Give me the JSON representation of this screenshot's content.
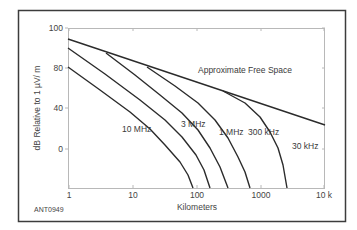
{
  "chart_data": {
    "type": "line",
    "title": "",
    "xlabel": "Kilometers",
    "ylabel": "dB Relative to 1 µV/ m",
    "xscale": "log",
    "xlim": [
      1,
      10000
    ],
    "x_ticks": [
      "1",
      "10",
      "100",
      "1000",
      "10 k"
    ],
    "y_ticks": [
      "100",
      "80",
      "40",
      "0"
    ],
    "grid": false,
    "figure_id": "ANT0949",
    "annotations": [
      "Approximate Free Space",
      "10 MHz",
      "3 MHz",
      "1 MHz",
      "300 kHz",
      "30 kHz"
    ],
    "series": [
      {
        "name": "Approximate Free Space",
        "x": [
          1,
          10000
        ],
        "y": [
          89,
          25
        ]
      },
      {
        "name": "10 MHz",
        "x": [
          1,
          9,
          27,
          57,
          90
        ],
        "y": [
          82,
          50,
          23,
          0,
          -20
        ]
      },
      {
        "name": "3 MHz",
        "x": [
          1,
          13,
          56,
          116,
          168
        ],
        "y": [
          94,
          53,
          27,
          3,
          -20
        ]
      },
      {
        "name": "1 MHz",
        "x": [
          4,
          27,
          94,
          193,
          308
        ],
        "y": [
          86,
          57,
          33,
          8,
          -20
        ]
      },
      {
        "name": "300 kHz",
        "x": [
          19,
          94,
          277,
          475,
          683
        ],
        "y": [
          78,
          52,
          30,
          7,
          -20
        ]
      },
      {
        "name": "30 kHz",
        "x": [
          298,
          939,
          1726,
          2475,
          2970
        ],
        "y": [
          59,
          45,
          26,
          6,
          -20
        ]
      }
    ]
  },
  "plot": {
    "px_left": 68,
    "px_right": 325,
    "px_top": 28,
    "px_bottom": 188,
    "x_tick_px": [
      69,
      133,
      197,
      261,
      324
    ],
    "y_tick_px": [
      28,
      68,
      108,
      149
    ],
    "curves_px": [
      {
        "name": "Approximate Free Space",
        "points": "68,39 325,125"
      },
      {
        "name": "10 MHz",
        "points": "68,67 100,90 130,112 150,129 165,145 180,162 188,175 193,188"
      },
      {
        "name": "3 MHz",
        "points": "68,48 105,74 140,100 165,120 182,137 196,155 204,170 210,188"
      },
      {
        "name": "1 MHz",
        "points": "106,53 135,75 160,95 182,113 198,130 210,148 220,167 228,188"
      },
      {
        "name": "300 kHz",
        "points": "147,67 175,86 198,103 215,120 228,138 238,157 245,172 250,188"
      },
      {
        "name": "30 kHz",
        "points": "223,91 245,103 260,117 270,132 278,148 283,165 287,188"
      }
    ],
    "labels_px": [
      {
        "text": "Approximate Free Space",
        "x": 198,
        "y": 73
      },
      {
        "text": "10 MHz",
        "x": 122,
        "y": 132
      },
      {
        "text": "3 MHz",
        "x": 181,
        "y": 127
      },
      {
        "text": "1 MHz",
        "x": 219,
        "y": 135
      },
      {
        "text": "300 kHz",
        "x": 248,
        "y": 135
      },
      {
        "text": "30 kHz",
        "x": 292,
        "y": 149
      }
    ]
  },
  "colors": {
    "line": "#2b2b2b",
    "axis": "#b8b8b8",
    "frame": "#3c3c3c",
    "text": "#3a3a3a"
  }
}
